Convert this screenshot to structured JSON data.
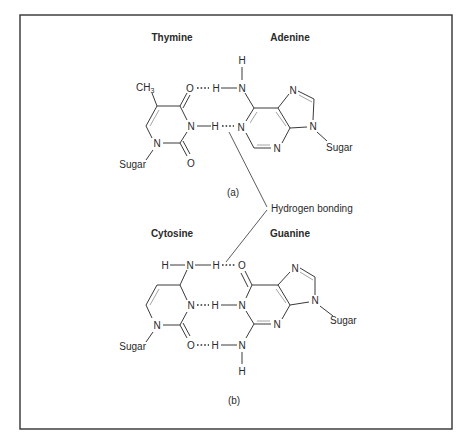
{
  "figure": {
    "panel_a": {
      "label": "(a)",
      "left_base": {
        "name": "Thymine",
        "atoms": {
          "methyl": "CH",
          "methyl_sub": "3",
          "o4": "O",
          "n3": "N",
          "o2": "O",
          "n1": "N",
          "sugar": "Sugar"
        }
      },
      "right_base": {
        "name": "Adenine",
        "atoms": {
          "h_top": "H",
          "n6": "N",
          "h6": "H",
          "n1": "N",
          "n3": "N",
          "n7": "N",
          "n9": "N",
          "sugar": "Sugar"
        }
      },
      "bridge_h": "H",
      "hydrogen_bonds": 2
    },
    "panel_b": {
      "label": "(b)",
      "left_base": {
        "name": "Cytosine",
        "atoms": {
          "h_left": "H",
          "n4": "N",
          "h4": "H",
          "n3": "N",
          "n1": "N",
          "o2": "O",
          "sugar": "Sugar"
        }
      },
      "right_base": {
        "name": "Guanine",
        "atoms": {
          "o6": "O",
          "n1": "N",
          "h1": "H",
          "n3": "N",
          "n2": "N",
          "h2": "H",
          "h_bottom": "H",
          "n7": "N",
          "n9": "N",
          "sugar": "Sugar"
        }
      },
      "hydrogen_bonds": 3
    },
    "callout": "Hydrogen bonding"
  }
}
